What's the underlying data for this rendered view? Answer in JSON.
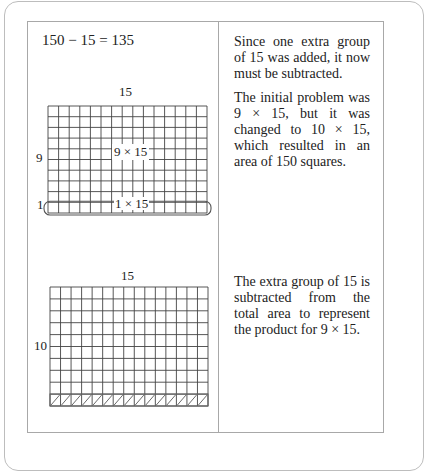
{
  "section1": {
    "equation": "150 − 15 = 135",
    "grid_top_label": "15",
    "grid_side_label_main": "9",
    "grid_side_label_extra": "1",
    "inner_label_main": "9 × 15",
    "inner_label_extra": "1 × 15",
    "paragraphs": [
      "Since one extra group of 15 was added, it now must be subtracted.",
      "The initial problem was 9 × 15, but it was changed to 10 × 15, which resulted in an area of 150 squares."
    ]
  },
  "section2": {
    "grid_top_label": "15",
    "grid_side_label": "10",
    "paragraphs": [
      "The extra group of 15 is subtracted from the total area to represent the product for 9 × 15."
    ]
  },
  "colors": {
    "grid_line": "#444444",
    "border": "#a8a8a8",
    "text": "#222222"
  },
  "grid": {
    "columns": 15,
    "rows": 10
  }
}
